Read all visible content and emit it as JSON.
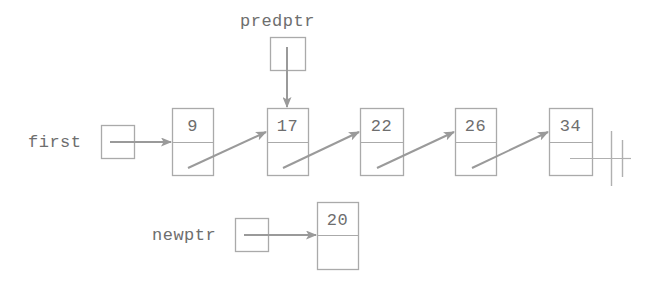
{
  "diagram": {
    "stroke_color": "#9a9a9a",
    "text_color": "#6e6e6e",
    "background_color": "#ffffff",
    "pointers": [
      {
        "name": "first",
        "label": "first",
        "box_x": 101,
        "box_y": 125,
        "box_w": 33,
        "box_h": 33
      },
      {
        "name": "predptr",
        "label": "predptr",
        "box_x": 270,
        "box_y": 37,
        "box_w": 35,
        "box_h": 33
      },
      {
        "name": "newptr",
        "label": "newptr",
        "box_x": 235,
        "box_y": 218,
        "box_w": 33,
        "box_h": 33
      }
    ],
    "list_nodes": [
      {
        "name": "node-9",
        "value": "9",
        "x": 172,
        "y": 108,
        "w": 41,
        "h": 67,
        "divider_offset": 34
      },
      {
        "name": "node-17",
        "value": "17",
        "x": 267,
        "y": 108,
        "w": 41,
        "h": 67,
        "divider_offset": 34
      },
      {
        "name": "node-22",
        "value": "22",
        "x": 360,
        "y": 108,
        "w": 43,
        "h": 67,
        "divider_offset": 34
      },
      {
        "name": "node-26",
        "value": "26",
        "x": 455,
        "y": 108,
        "w": 41,
        "h": 67,
        "divider_offset": 34
      },
      {
        "name": "node-34",
        "value": "34",
        "x": 549,
        "y": 108,
        "w": 43,
        "h": 67,
        "divider_offset": 34
      }
    ],
    "new_node": {
      "name": "node-20",
      "value": "20",
      "x": 317,
      "y": 202,
      "w": 41,
      "h": 67,
      "divider_offset": 33
    },
    "null_terminator": {
      "name": "null-terminator",
      "x": 610,
      "y": 142
    },
    "labels": {
      "first_label_x": 28,
      "first_label_y": 134,
      "predptr_label_x": 240,
      "predptr_label_y": 14,
      "newptr_label_x": 152,
      "newptr_label_y": 227
    }
  }
}
